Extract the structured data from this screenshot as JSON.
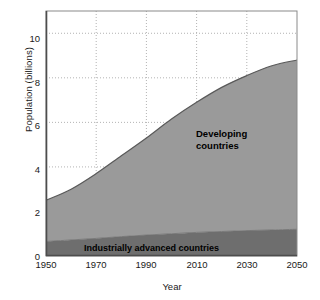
{
  "chart_data": {
    "type": "area",
    "title": "",
    "xlabel": "Year",
    "ylabel": "Population (billions)",
    "xlim": [
      1950,
      2050
    ],
    "ylim": [
      0,
      11
    ],
    "xticks": [
      "1950",
      "1970",
      "1990",
      "2010",
      "2030",
      "2050"
    ],
    "yticks": [
      "0",
      "2",
      "4",
      "6",
      "8",
      "10"
    ],
    "grid": "dotted",
    "legend_position": "inside-plot",
    "x": [
      1950,
      1960,
      1970,
      1980,
      1990,
      2000,
      2010,
      2020,
      2030,
      2040,
      2050
    ],
    "series": [
      {
        "name": "Industrially advanced countries",
        "color": "#6e6e6e",
        "values": [
          0.65,
          0.72,
          0.79,
          0.87,
          0.94,
          1.0,
          1.06,
          1.1,
          1.14,
          1.17,
          1.2
        ]
      },
      {
        "name": "Developing countries",
        "color": "#9a9a9a",
        "values": [
          1.85,
          2.28,
          2.91,
          3.63,
          4.36,
          5.15,
          5.84,
          6.47,
          6.96,
          7.37,
          7.6
        ]
      }
    ],
    "totals": [
      2.5,
      3.0,
      3.7,
      4.5,
      5.3,
      6.15,
      6.9,
      7.57,
      8.1,
      8.54,
      8.8
    ],
    "annotations": [
      {
        "name": "developing-countries-label",
        "text_lines": [
          "Developing",
          "countries"
        ],
        "x": 2012,
        "y": 6.2
      },
      {
        "name": "industrially-advanced-label",
        "text_lines": [
          "Industrially advanced countries"
        ],
        "x": 1995,
        "y": 0.35
      }
    ]
  },
  "colors": {
    "developing_fill": "#9a9a9a",
    "advanced_fill": "#6e6e6e",
    "curve_line": "#595959",
    "grid": "#b3b3b3",
    "axis": "#4d4d4d",
    "background": "#ffffff",
    "text": "#1a1a1a"
  },
  "axis": {
    "y_title": "Population (billions)",
    "x_title": "Year",
    "y_ticks": [
      "10",
      "8",
      "6",
      "4",
      "2",
      "0"
    ],
    "x_ticks": [
      "1950",
      "1970",
      "1990",
      "2010",
      "2030",
      "2050"
    ]
  },
  "legend": {
    "developing_line1": "Developing",
    "developing_line2": "countries",
    "advanced": "Industrially advanced countries"
  }
}
